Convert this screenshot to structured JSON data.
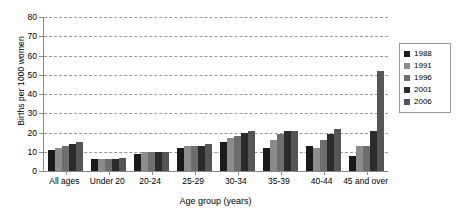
{
  "chart_data": {
    "type": "bar",
    "title": "",
    "xlabel": "Age group (years)",
    "ylabel": "Births per 1000 women",
    "ylim": [
      0,
      80
    ],
    "yticks": [
      0,
      10,
      20,
      30,
      40,
      50,
      60,
      70,
      80
    ],
    "grid": true,
    "legend_position": "right",
    "categories": [
      "All ages",
      "Under 20",
      "20-24",
      "25-29",
      "30-34",
      "35-39",
      "40-44",
      "45 and over"
    ],
    "series": [
      {
        "name": "1988",
        "color": "#1a1a1a",
        "values": [
          11,
          6,
          9,
          12,
          15,
          12,
          13,
          8
        ]
      },
      {
        "name": "1991",
        "color": "#8c8c8c",
        "values": [
          12,
          6,
          10,
          13,
          17,
          16,
          12,
          13
        ]
      },
      {
        "name": "1996",
        "color": "#6e6e6e",
        "values": [
          13,
          6,
          10,
          13,
          18,
          19,
          16,
          13
        ]
      },
      {
        "name": "2001",
        "color": "#2b2b2b",
        "values": [
          14,
          6,
          10,
          13,
          20,
          21,
          19,
          21
        ]
      },
      {
        "name": "2006",
        "color": "#555555",
        "values": [
          15,
          7,
          10,
          14,
          21,
          21,
          22,
          52
        ]
      }
    ],
    "extra_series_note": ""
  },
  "legend": {
    "items": [
      {
        "label": "1988",
        "color": "#1a1a1a"
      },
      {
        "label": "1991",
        "color": "#8c8c8c"
      },
      {
        "label": "1996",
        "color": "#6e6e6e"
      },
      {
        "label": "2001",
        "color": "#2b2b2b"
      },
      {
        "label": "2006",
        "color": "#555555"
      }
    ]
  },
  "axis": {
    "y_title": "Births per 1000 women",
    "x_title": "Age group (years)",
    "y_tick_labels": [
      "0",
      "10",
      "20",
      "30",
      "40",
      "50",
      "60",
      "70",
      "80"
    ],
    "x_tick_labels": [
      "All ages",
      "Under 20",
      "20-24",
      "25-29",
      "30-34",
      "35-39",
      "40-44",
      "45 and over"
    ]
  }
}
